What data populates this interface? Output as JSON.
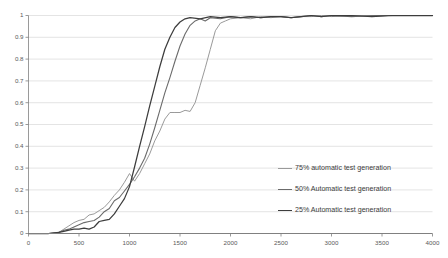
{
  "chart_data": {
    "type": "line",
    "title": "",
    "xlabel": "",
    "ylabel": "",
    "xlim": [
      0,
      4000
    ],
    "ylim": [
      0,
      1
    ],
    "grid": "horizontal",
    "legend_position": "center-right",
    "x_ticks": [
      "0",
      "500",
      "1000",
      "1500",
      "2000",
      "2500",
      "3000",
      "3500",
      "4000"
    ],
    "x_tick_values": [
      0,
      500,
      1000,
      1500,
      2000,
      2500,
      3000,
      3500,
      4000
    ],
    "y_ticks": [
      "0",
      "0.1",
      "0.2",
      "0.3",
      "0.4",
      "0.5",
      "0.6",
      "0.7",
      "0.8",
      "0.9",
      "1"
    ],
    "y_tick_values": [
      0,
      0.1,
      0.2,
      0.3,
      0.4,
      0.5,
      0.6,
      0.7,
      0.8,
      0.9,
      1
    ],
    "series": [
      {
        "name": "75% automatic test generation",
        "color": "#9a9a9a",
        "width": 1.0,
        "x": [
          0,
          100,
          200,
          300,
          350,
          400,
          450,
          500,
          550,
          600,
          650,
          700,
          750,
          800,
          850,
          900,
          950,
          1000,
          1050,
          1100,
          1150,
          1200,
          1250,
          1300,
          1350,
          1400,
          1450,
          1500,
          1550,
          1600,
          1650,
          1700,
          1750,
          1800,
          1850,
          1900,
          1950,
          2000,
          2100,
          2200,
          2300,
          2400,
          2500,
          2600,
          2700,
          2800,
          2900,
          3000,
          3200,
          3400,
          3600,
          3800,
          4000
        ],
        "y": [
          0,
          0,
          0,
          0.005,
          0.02,
          0.035,
          0.05,
          0.06,
          0.065,
          0.085,
          0.09,
          0.105,
          0.12,
          0.145,
          0.175,
          0.2,
          0.235,
          0.275,
          0.24,
          0.275,
          0.32,
          0.365,
          0.425,
          0.47,
          0.525,
          0.555,
          0.555,
          0.555,
          0.565,
          0.56,
          0.6,
          0.68,
          0.76,
          0.845,
          0.93,
          0.965,
          0.975,
          0.985,
          0.99,
          0.985,
          0.995,
          0.99,
          0.995,
          0.99,
          0.995,
          0.995,
          1,
          0.995,
          1,
          0.995,
          1,
          1,
          1
        ]
      },
      {
        "name": "50% Automatic test generation",
        "color": "#6b6b6b",
        "width": 1.1,
        "x": [
          0,
          100,
          200,
          300,
          350,
          400,
          450,
          500,
          550,
          600,
          650,
          700,
          750,
          800,
          850,
          900,
          950,
          1000,
          1050,
          1100,
          1150,
          1200,
          1250,
          1300,
          1350,
          1400,
          1450,
          1500,
          1550,
          1600,
          1650,
          1700,
          1750,
          1800,
          1900,
          2000,
          2100,
          2200,
          2300,
          2400,
          2500,
          2600,
          2700,
          2800,
          2900,
          3000,
          3200,
          3400,
          3600,
          3800,
          4000
        ],
        "y": [
          0,
          0,
          0,
          0.005,
          0.015,
          0.02,
          0.03,
          0.04,
          0.05,
          0.055,
          0.06,
          0.075,
          0.1,
          0.115,
          0.15,
          0.165,
          0.195,
          0.225,
          0.26,
          0.3,
          0.345,
          0.41,
          0.485,
          0.565,
          0.645,
          0.715,
          0.79,
          0.86,
          0.915,
          0.955,
          0.975,
          0.985,
          0.975,
          0.99,
          0.985,
          0.995,
          0.99,
          0.995,
          0.99,
          0.995,
          0.995,
          0.99,
          0.995,
          1,
          0.995,
          1,
          0.995,
          1,
          1,
          1,
          1
        ]
      },
      {
        "name": "25% Automatic test generation",
        "color": "#3d3d3d",
        "width": 1.25,
        "x": [
          0,
          100,
          200,
          300,
          350,
          400,
          450,
          500,
          550,
          600,
          650,
          700,
          750,
          800,
          850,
          900,
          950,
          1000,
          1050,
          1100,
          1150,
          1200,
          1250,
          1300,
          1350,
          1400,
          1450,
          1500,
          1550,
          1600,
          1700,
          1800,
          1900,
          2000,
          2100,
          2200,
          2300,
          2400,
          2500,
          2600,
          2700,
          2800,
          2900,
          3000,
          3200,
          3400,
          3600,
          3800,
          4000
        ],
        "y": [
          0,
          0,
          0,
          0.005,
          0.01,
          0.015,
          0.02,
          0.02,
          0.025,
          0.02,
          0.03,
          0.055,
          0.06,
          0.065,
          0.09,
          0.125,
          0.16,
          0.215,
          0.305,
          0.4,
          0.49,
          0.585,
          0.675,
          0.765,
          0.845,
          0.9,
          0.945,
          0.97,
          0.985,
          0.99,
          0.985,
          0.995,
          0.99,
          0.995,
          0.99,
          0.995,
          0.99,
          0.995,
          0.995,
          0.99,
          0.995,
          1,
          0.995,
          1,
          1,
          0.995,
          1,
          1,
          1
        ]
      }
    ]
  },
  "axes": {
    "axis_line_color": "#808080",
    "grid_color": "#d9d9d9",
    "tick_label_color": "#595959"
  },
  "legend": {
    "entries": [
      {
        "label": "75% automatic test generation"
      },
      {
        "label": "50% Automatic test generation"
      },
      {
        "label": "25% Automatic test generation"
      }
    ]
  }
}
